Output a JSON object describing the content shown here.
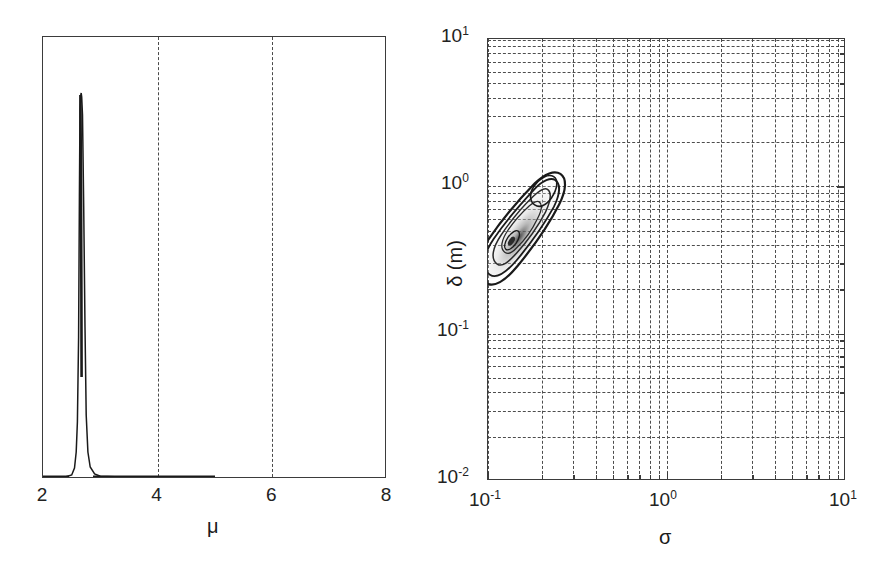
{
  "figure": {
    "background": "#ffffff",
    "line_color": "#1a1a1a",
    "grid_color": "#4d4d4d",
    "panel_count": 2
  },
  "chart_data": [
    {
      "id": "left-panel",
      "type": "line",
      "title": "",
      "subtitle": "",
      "xlabel": "μ",
      "ylabel": "",
      "xlim": [
        2,
        8
      ],
      "ylim": [
        0,
        1
      ],
      "xscale": "linear",
      "yscale": "linear",
      "xticks": [
        2,
        4,
        6,
        8
      ],
      "xticklabels": [
        "2",
        "4",
        "6",
        "8"
      ],
      "yticks": [],
      "yticklabels": [],
      "grid": "vertical-dashed-at-4-and-6",
      "legend": "none",
      "description": "Marginal posterior probability density of mu: a single extremely narrow spike near mu = 2.65 rising to full axis height, with a near-zero bold baseline from mu = 2 to about mu = 5.",
      "peak_x": 2.65,
      "peak_y": 1.0,
      "baseline_bold_range": [
        2,
        5
      ],
      "series": [
        {
          "name": "p(μ)",
          "x": [
            2.0,
            2.2,
            2.4,
            2.5,
            2.55,
            2.58,
            2.6,
            2.62,
            2.635,
            2.645,
            2.65,
            2.655,
            2.665,
            2.68,
            2.7,
            2.72,
            2.75,
            2.8,
            2.9,
            3.0,
            3.5,
            4.0,
            4.5,
            5.0,
            5.5,
            6.0,
            6.5,
            7.0,
            7.5,
            8.0
          ],
          "y": [
            0.004,
            0.004,
            0.005,
            0.008,
            0.02,
            0.06,
            0.2,
            0.5,
            0.85,
            0.97,
            1.0,
            0.96,
            0.8,
            0.45,
            0.18,
            0.06,
            0.02,
            0.008,
            0.005,
            0.004,
            0.004,
            0.004,
            0.004,
            0.004,
            0.002,
            0.002,
            0.002,
            0.002,
            0.002,
            0.002
          ]
        }
      ]
    },
    {
      "id": "right-panel",
      "type": "contour",
      "title": "",
      "subtitle": "",
      "xlabel": "σ",
      "ylabel": "δ (m)",
      "xlim": [
        0.1,
        10
      ],
      "ylim": [
        0.01,
        10
      ],
      "xscale": "log",
      "yscale": "log",
      "xticks": [
        0.1,
        1,
        10
      ],
      "xticklabels": [
        "10⁻¹",
        "10⁰",
        "10¹"
      ],
      "yticks": [
        0.01,
        0.1,
        1,
        10
      ],
      "yticklabels": [
        "10⁻²",
        "10⁻¹",
        "10⁰",
        "10¹"
      ],
      "grid": "log-minor-dashed-both-axes",
      "legend": "none",
      "description": "Joint posterior density contours of sigma versus delta on log-log axes. An elongated, positively-correlated banana-shaped cluster of nested contours with a shaded grey interior sits in the lower-left region, spanning sigma from about 0.11 to 0.22 and delta from about 0.15 to 0.62, with the density maximum near sigma = 0.14, delta = 0.25.",
      "mode": {
        "sigma": 0.14,
        "delta": 0.25
      },
      "extent": {
        "sigma": [
          0.11,
          0.22
        ],
        "delta": [
          0.15,
          0.62
        ]
      },
      "contour_levels": [
        "outermost",
        "mid",
        "inner",
        "peak"
      ]
    }
  ],
  "left_panel": {
    "xlabel": "μ",
    "xticklabels": [
      "2",
      "4",
      "6",
      "8"
    ],
    "gridline_values": [
      "4",
      "6"
    ]
  },
  "right_panel": {
    "xlabel": "σ",
    "ylabel": "δ (m)",
    "x_tick_base": "10",
    "x_tick_exponents": [
      "-1",
      "0",
      "1"
    ],
    "y_tick_base": "10",
    "y_tick_exponents": [
      "1",
      "0",
      "-1",
      "-2"
    ]
  }
}
